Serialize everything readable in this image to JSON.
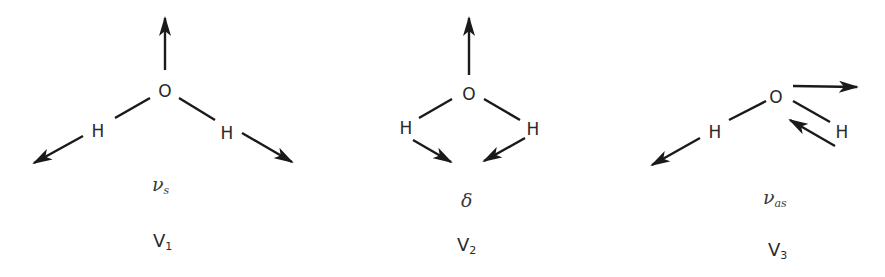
{
  "modes": [
    {
      "id": "v1",
      "atoms": {
        "center": "O",
        "left": "H",
        "right": "H"
      },
      "symbol": {
        "base": "ν",
        "subscript": "s"
      },
      "label": {
        "base": "V",
        "subscript": "1"
      },
      "description": "symmetric stretch"
    },
    {
      "id": "v2",
      "atoms": {
        "center": "O",
        "left": "H",
        "right": "H"
      },
      "symbol": {
        "base": "δ",
        "subscript": ""
      },
      "label": {
        "base": "V",
        "subscript": "2"
      },
      "description": "bending"
    },
    {
      "id": "v3",
      "atoms": {
        "center": "O",
        "left": "H",
        "right": "H"
      },
      "symbol": {
        "base": "ν",
        "subscript": "as"
      },
      "label": {
        "base": "V",
        "subscript": "3"
      },
      "description": "asymmetric stretch"
    }
  ],
  "colors": {
    "ink": "#1a1a1a",
    "text": "#2a2a2a"
  }
}
